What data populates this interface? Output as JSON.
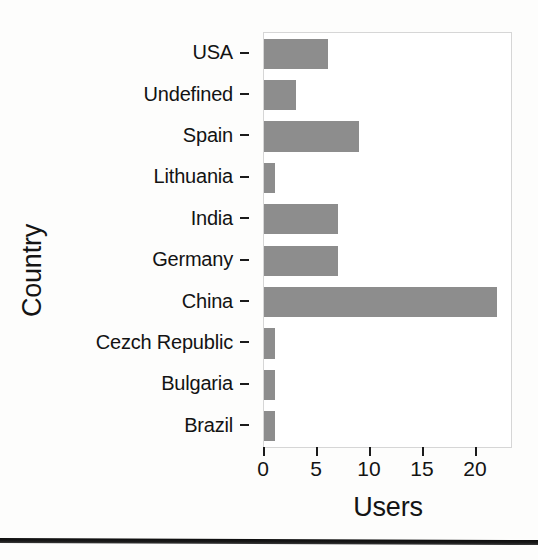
{
  "chart_data": {
    "type": "bar",
    "orientation": "horizontal",
    "title": "",
    "xlabel": "Users",
    "ylabel": "Country",
    "categories": [
      "USA",
      "Undefined",
      "Spain",
      "Lithuania",
      "India",
      "Germany",
      "China",
      "Cezch Republic",
      "Bulgaria",
      "Brazil"
    ],
    "values": [
      6,
      3,
      9,
      1,
      7,
      7,
      22,
      1,
      1,
      1
    ],
    "xticks": [
      0,
      5,
      10,
      15,
      20
    ],
    "xtick_labels": [
      "0",
      "5",
      "10",
      "15",
      "20"
    ],
    "xlim": [
      0,
      23.3
    ],
    "grid": false,
    "legend": false,
    "bar_color": "#8d8d8d",
    "panel_border_color": "#d6d6d6",
    "text_color": "#131313"
  },
  "axes": {
    "y_title": "Country",
    "x_title": "Users"
  }
}
